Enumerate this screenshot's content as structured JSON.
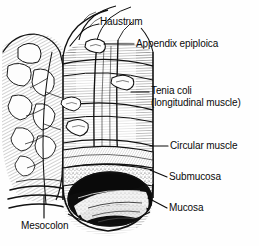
{
  "figure": {
    "background_color": "#fefefe",
    "ink_color": "#0a0a0a",
    "width": 259,
    "height": 246
  },
  "labels": {
    "haustrum": "Haustrum",
    "appendix_epiploica": "Appendix epiploica",
    "tenia_coli_line1": "Tenia coli",
    "tenia_coli_line2": "(longitudinal muscle)",
    "circular_muscle": "Circular muscle",
    "submucosa": "Submucosa",
    "mucosa": "Mucosa",
    "mesocolon": "Mesocolon"
  }
}
